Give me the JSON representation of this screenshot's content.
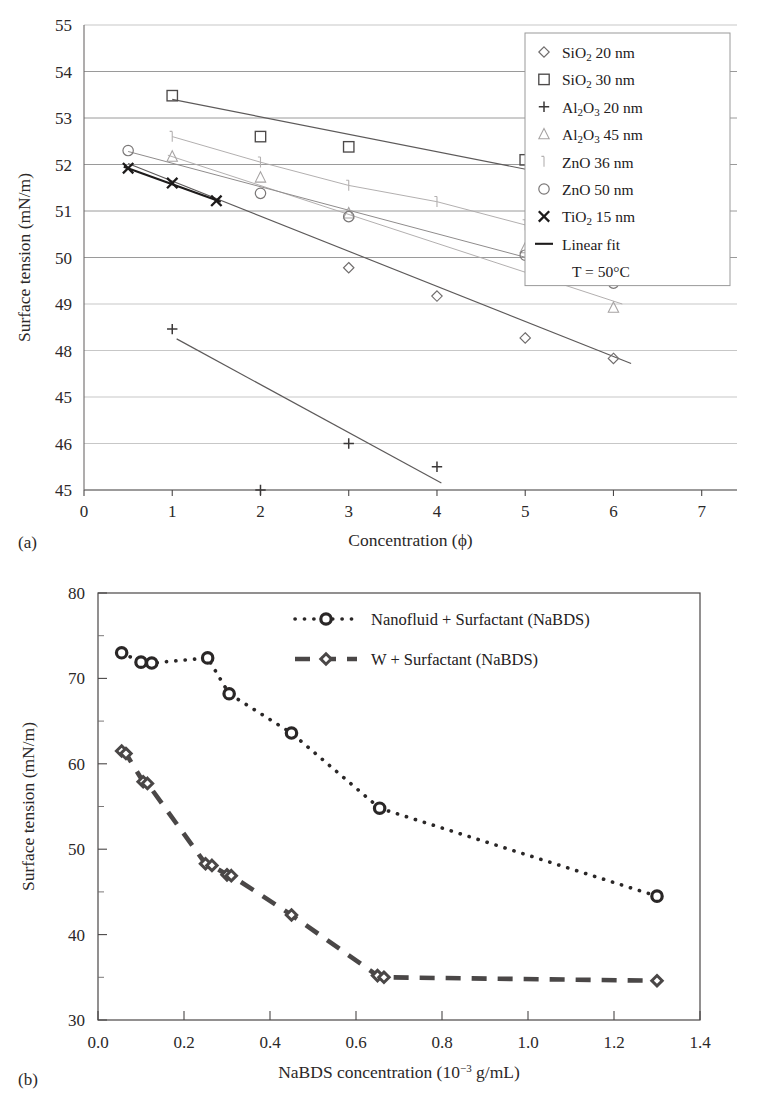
{
  "figure": {
    "panel_a_label": "(a)",
    "panel_b_label": "(b)"
  },
  "chart_data": [
    {
      "id": "a",
      "type": "scatter",
      "title": "",
      "xlabel": "Concentration (ϕ)",
      "ylabel": "Surface tension (mN/m)",
      "xlim": [
        0,
        7.4
      ],
      "ylim": [
        45,
        55
      ],
      "xticks": [
        "0",
        "1",
        "2",
        "3",
        "4",
        "5",
        "6",
        "7"
      ],
      "yticks": [
        "55",
        "54",
        "53",
        "52",
        "51",
        "50",
        "49",
        "48",
        "45",
        "46",
        "45"
      ],
      "grid": "horizontal",
      "legend_position": "top-right",
      "annotation": "T = 50°C",
      "series": [
        {
          "name": "SiO2 20 nm",
          "label_parts": {
            "pre": "SiO",
            "sub": "2",
            "post": " 20 nm"
          },
          "marker": "diamond",
          "x": [
            3,
            4,
            5,
            6
          ],
          "y": [
            49.78,
            49.17,
            48.27,
            47.83
          ],
          "fit": {
            "x": [
              0.5,
              6.2
            ],
            "y": [
              52.02,
              47.72
            ]
          }
        },
        {
          "name": "SiO2 30 nm",
          "label_parts": {
            "pre": "SiO",
            "sub": "2",
            "post": " 30 nm"
          },
          "marker": "square",
          "x": [
            1,
            2,
            3,
            5,
            6
          ],
          "y": [
            53.48,
            52.6,
            52.38,
            52.1,
            51.55
          ],
          "fit": {
            "x": [
              1,
              6.2
            ],
            "y": [
              53.4,
              51.45
            ]
          }
        },
        {
          "name": "Al2O3 20 nm",
          "label_parts": {
            "pre": "Al",
            "sub": "2",
            "mid": "O",
            "sub2": "3",
            "post": " 20 nm"
          },
          "marker": "plus",
          "x": [
            1,
            2,
            3,
            4
          ],
          "y": [
            48.46,
            45.0,
            46.0,
            45.5
          ],
          "fit": {
            "x": [
              1.05,
              4.05
            ],
            "y": [
              48.25,
              45.15
            ]
          }
        },
        {
          "name": "Al2O3 45 nm",
          "label_parts": {
            "pre": "Al",
            "sub": "2",
            "mid": "O",
            "sub2": "3",
            "post": " 45 nm"
          },
          "marker": "triangle",
          "x": [
            1,
            2,
            3,
            5,
            6
          ],
          "y": [
            52.17,
            51.72,
            50.95,
            50.2,
            48.92
          ],
          "fit": {
            "x": [
              0.95,
              6.1
            ],
            "y": [
              52.2,
              49.0
            ]
          }
        },
        {
          "name": "ZnO 36 nm",
          "label_parts": {
            "pre": "ZnO 36 nm"
          },
          "marker": "tick",
          "x": [
            1,
            2,
            3,
            4,
            5
          ],
          "y": [
            52.6,
            52.05,
            51.55,
            51.2,
            50.7
          ],
          "fit": null
        },
        {
          "name": "ZnO 50 nm",
          "label_parts": {
            "pre": "ZnO 50 nm"
          },
          "marker": "circle",
          "x": [
            0.5,
            2,
            3,
            5,
            6
          ],
          "y": [
            52.3,
            51.38,
            50.88,
            50.05,
            49.45
          ],
          "fit": {
            "x": [
              0.5,
              6.1
            ],
            "y": [
              52.28,
              49.45
            ]
          }
        },
        {
          "name": "TiO2 15 nm",
          "label_parts": {
            "pre": "TiO",
            "sub": "2",
            "post": " 15 nm"
          },
          "marker": "cross",
          "x": [
            0.5,
            1,
            1.5
          ],
          "y": [
            51.92,
            51.6,
            51.22
          ],
          "fit": {
            "x": [
              0.45,
              1.55
            ],
            "y": [
              51.95,
              51.2
            ]
          }
        },
        {
          "name": "Linear fit",
          "label_parts": {
            "pre": "Linear fit"
          },
          "marker": "line",
          "x": [],
          "y": [],
          "fit": null
        }
      ]
    },
    {
      "id": "b",
      "type": "line",
      "title": "",
      "xlabel": "NaBDS concentration (10−3 g/mL)",
      "ylabel": "Surface tension (mN/m)",
      "xlim": [
        0.0,
        1.4
      ],
      "ylim": [
        30,
        80
      ],
      "xticks": [
        "0.0",
        "0.2",
        "0.4",
        "0.6",
        "0.8",
        "1.0",
        "1.2",
        "1.4"
      ],
      "yticks": [
        "30",
        "40",
        "50",
        "60",
        "70",
        "80"
      ],
      "yminor_step": 5,
      "grid": "none",
      "legend_position": "top-right",
      "series": [
        {
          "name": "Nanofluid + Surfactant (NaBDS)",
          "marker": "circle",
          "line": "dotted",
          "x": [
            0.055,
            0.1,
            0.125,
            0.255,
            0.305,
            0.45,
            0.655,
            1.3
          ],
          "y": [
            73.0,
            71.9,
            71.8,
            72.4,
            68.2,
            63.6,
            54.8,
            44.5
          ]
        },
        {
          "name": "W + Surfactant (NaBDS)",
          "marker": "diamond",
          "line": "dashed",
          "x": [
            0.055,
            0.065,
            0.105,
            0.115,
            0.25,
            0.265,
            0.3,
            0.31,
            0.45,
            0.65,
            0.665,
            1.3
          ],
          "y": [
            61.5,
            61.2,
            57.9,
            57.7,
            48.3,
            48.1,
            47.0,
            46.9,
            42.3,
            35.2,
            35.0,
            34.6
          ]
        }
      ]
    }
  ]
}
